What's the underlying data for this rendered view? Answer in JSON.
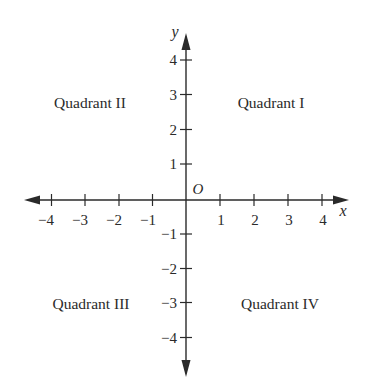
{
  "diagram": {
    "type": "coordinate-plane",
    "axes": {
      "x": {
        "label": "x",
        "ticks": [
          -4,
          -3,
          -2,
          -1,
          1,
          2,
          3,
          4
        ],
        "tick_labels": [
          "−4",
          "−3",
          "−2",
          "−1",
          "1",
          "2",
          "3",
          "4"
        ]
      },
      "y": {
        "label": "y",
        "ticks": [
          4,
          3,
          2,
          1,
          -1,
          -2,
          -3,
          -4
        ],
        "tick_labels": [
          "4",
          "3",
          "2",
          "1",
          "−1",
          "−2",
          "−3",
          "−4"
        ]
      },
      "origin_label": "O"
    },
    "quadrants": {
      "q1": "Quadrant I",
      "q2": "Quadrant II",
      "q3": "Quadrant III",
      "q4": "Quadrant IV"
    },
    "colors": {
      "ink": "#2a2a2a",
      "background": "#ffffff"
    }
  }
}
